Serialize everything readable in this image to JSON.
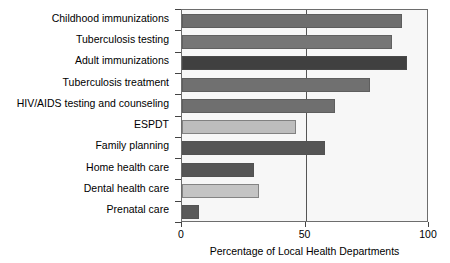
{
  "chart_data": {
    "type": "bar",
    "orientation": "horizontal",
    "title": "",
    "xlabel": "Percentage of Local Health Departments",
    "ylabel": "",
    "xlim": [
      0,
      100
    ],
    "xticks": [
      0,
      50,
      100
    ],
    "xticklabels": [
      "0",
      "50",
      "100"
    ],
    "grid": "single vertical line at 50",
    "legend": "none",
    "categories": [
      "Childhood immunizations",
      "Tuberculosis testing",
      "Adult immunizations",
      "Tuberculosis treatment",
      "HIV/AIDS testing and counseling",
      "ESPDT",
      "Family planning",
      "Home health care",
      "Dental health care",
      "Prenatal care"
    ],
    "values": [
      89,
      85,
      91,
      76,
      62,
      46,
      58,
      29,
      31,
      7
    ],
    "bar_colors": [
      "#6e6e6e",
      "#767676",
      "#404040",
      "#707070",
      "#6f6f6f",
      "#bdbdbd",
      "#555555",
      "#565656",
      "#c4c4c4",
      "#5a5a5a"
    ],
    "plot_background": "#f7f7f7",
    "axis_color": "#6d6d6d"
  }
}
